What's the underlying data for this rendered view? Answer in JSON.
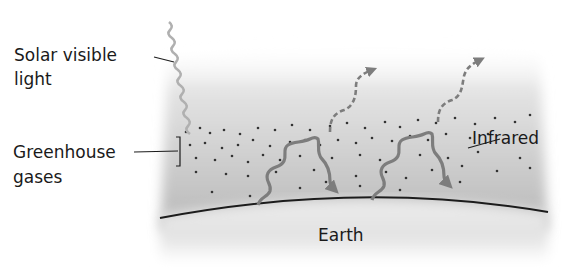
{
  "diagram": {
    "labels": {
      "solar_line1": "Solar visible",
      "solar_line2": "light",
      "greenhouse_line1": "Greenhouse",
      "greenhouse_line2": "gases",
      "infrared": "Infrared",
      "earth": "Earth"
    },
    "colors": {
      "atmosphere_top": "#e6e6e6",
      "atmosphere_bottom": "#b9b9b9",
      "earth_fill": "#e8e8e8",
      "arrow": "#7d7d7d",
      "solar_ray": "#b0b0b0",
      "dots": "#333333",
      "horizon": "#1c1c1c"
    }
  }
}
